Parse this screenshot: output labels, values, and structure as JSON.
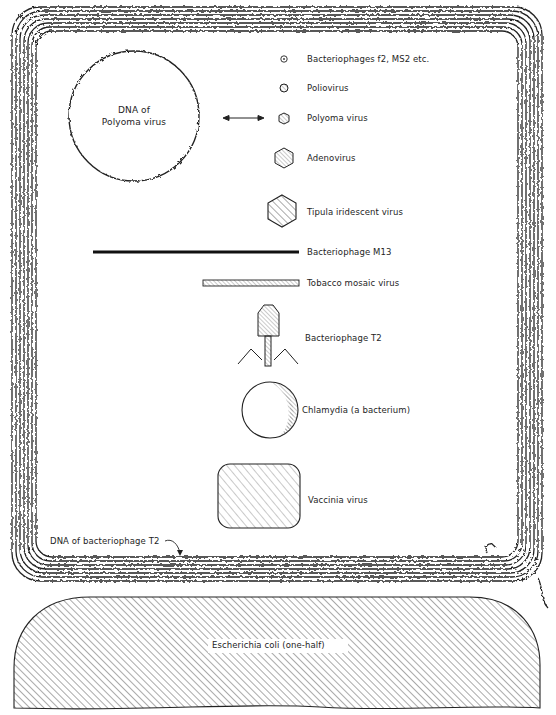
{
  "figure": {
    "colors": {
      "ink": "#1e1e1e",
      "hatch": "#555555",
      "background": "#ffffff"
    }
  },
  "specimens": [
    {
      "id": "f2",
      "label": "Bacteriophages f2, MS2 etc.",
      "shape": "tiny-circle",
      "icon": "small-circle-icon"
    },
    {
      "id": "polio",
      "label": "Poliovirus",
      "shape": "small-hexagon",
      "icon": "small-polyhedron-icon"
    },
    {
      "id": "polyoma",
      "label": "Polyoma virus",
      "shape": "small-hexagon",
      "icon": "polyhedron-icon"
    },
    {
      "id": "adeno",
      "label": "Adenovirus",
      "shape": "hexagon",
      "icon": "hexagon-icon"
    },
    {
      "id": "tipula",
      "label": "Tipula iridescent virus",
      "shape": "large-hexagon",
      "icon": "large-hexagon-icon"
    },
    {
      "id": "m13",
      "label": "Bacteriophage M13",
      "shape": "long-filament",
      "icon": "filament-icon"
    },
    {
      "id": "tmv",
      "label": "Tobacco mosaic virus",
      "shape": "rod",
      "icon": "rod-icon"
    },
    {
      "id": "t2",
      "label": "Bacteriophage T2",
      "shape": "tailed-phage",
      "icon": "phage-icon"
    },
    {
      "id": "chlamydia",
      "label": "Chlamydia (a bacterium)",
      "shape": "sphere",
      "icon": "sphere-icon"
    },
    {
      "id": "vaccinia",
      "label": "Vaccinia virus",
      "shape": "rounded-brick",
      "icon": "brick-icon"
    }
  ],
  "dna_polyoma": {
    "label_line1": "DNA of",
    "label_line2": "Polyoma virus"
  },
  "dna_t2": {
    "label": "DNA of bacteriophage T2"
  },
  "ecoli": {
    "label": "Escherichia coli (one-half)"
  }
}
